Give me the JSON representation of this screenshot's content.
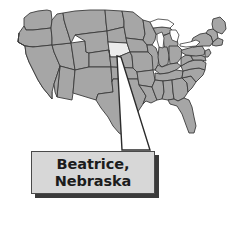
{
  "figure": {
    "type": "locator-map",
    "background_color": "#ffffff",
    "width": 236,
    "height": 237
  },
  "map": {
    "name": "united-states-map",
    "region": "Contiguous United States",
    "state_fill_color": "#a6a6a6",
    "state_border_color": "#3b3b3b",
    "water_color": "#ffffff",
    "highlighted_state": {
      "name": "Nebraska",
      "fill_color": "#ececec"
    }
  },
  "leader": {
    "name": "callout-leader-wedge",
    "from": "Nebraska",
    "to": "callout-box",
    "fill_color": "#ffffff",
    "stroke_color": "#2b2b2b"
  },
  "callout": {
    "name": "location-callout",
    "line1": "Beatrice,",
    "line2": "Nebraska",
    "city": "Beatrice",
    "state": "Nebraska",
    "box_fill_color": "#d7d7d7",
    "box_border_color": "#4a4a4a",
    "shadow_color": "#3a3a3a",
    "text_color": "#1c1c1c"
  }
}
